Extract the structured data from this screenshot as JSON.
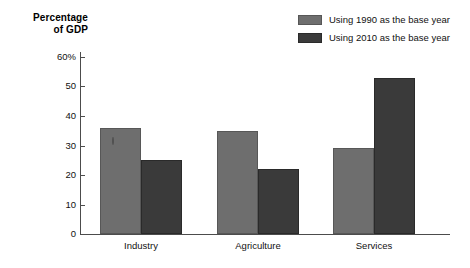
{
  "chart_data": {
    "type": "bar",
    "title": "",
    "xlabel": "",
    "ylabel": "Percentage of GDP",
    "ylabel_line1": "Percentage",
    "ylabel_line2": "of GDP",
    "categories": [
      "Industry",
      "Agriculture",
      "Services"
    ],
    "series": [
      {
        "name": "Using 1990 as the base year",
        "color": "#6e6e6e",
        "values": [
          36,
          35,
          29
        ]
      },
      {
        "name": "Using 2010 as the base year",
        "color": "#3a3a3a",
        "values": [
          25,
          22,
          53
        ]
      }
    ],
    "ylim": [
      0,
      60
    ],
    "yticks": [
      0,
      10,
      20,
      30,
      40,
      50,
      60
    ],
    "ytick_labels": [
      "0",
      "10",
      "20",
      "30",
      "40",
      "50",
      "60%"
    ],
    "grid": false,
    "legend_position": "top-right"
  },
  "legend": {
    "items": [
      {
        "label": "Using 1990 as the base year"
      },
      {
        "label": "Using 2010 as the base year"
      }
    ]
  },
  "axis": {
    "y_title_line1": "Percentage",
    "y_title_line2": "of GDP",
    "ticks": [
      "60%",
      "50",
      "40",
      "30",
      "20",
      "10",
      "0"
    ]
  },
  "categories": {
    "industry": "Industry",
    "agriculture": "Agriculture",
    "services": "Services"
  }
}
